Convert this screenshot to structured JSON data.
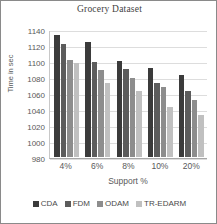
{
  "chart_data": {
    "type": "bar",
    "title": "Grocery Dataset",
    "xlabel": "Support %",
    "ylabel": "Time in sec",
    "categories": [
      "4%",
      "6%",
      "8%",
      "10%",
      "20%"
    ],
    "series": [
      {
        "name": "CDA",
        "color": "#3b3b3b",
        "values": [
          1132,
          1124,
          1100,
          1091,
          1082
        ]
      },
      {
        "name": "FDM",
        "color": "#5c5c5c",
        "values": [
          1121,
          1099,
          1090,
          1072,
          1063
        ]
      },
      {
        "name": "ODAM",
        "color": "#8d8d8d",
        "values": [
          1101,
          1089,
          1079,
          1067,
          1051
        ]
      },
      {
        "name": "TR-EDARM",
        "color": "#c0c0c0",
        "values": [
          1098,
          1073,
          1062,
          1042,
          1032
        ]
      }
    ],
    "ylim": [
      980,
      1140
    ],
    "yticks": [
      980,
      1000,
      1020,
      1040,
      1060,
      1080,
      1100,
      1120,
      1140
    ],
    "grid": true,
    "legend_position": "bottom"
  }
}
